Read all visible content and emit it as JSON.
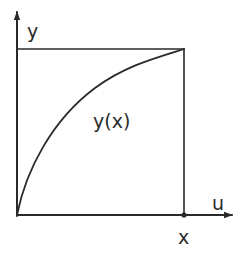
{
  "diagram": {
    "type": "function-plot-sketch",
    "axes": {
      "vertical_label": "y",
      "horizontal_label": "u"
    },
    "curve": {
      "label": "y(x)",
      "shape": "concave increasing",
      "from": "origin",
      "to": "top-right corner of square"
    },
    "marker": {
      "label": "x",
      "position": "on horizontal axis, below right edge of square"
    },
    "colors": {
      "ink": "#2a2a2a",
      "background": "#ffffff"
    }
  }
}
